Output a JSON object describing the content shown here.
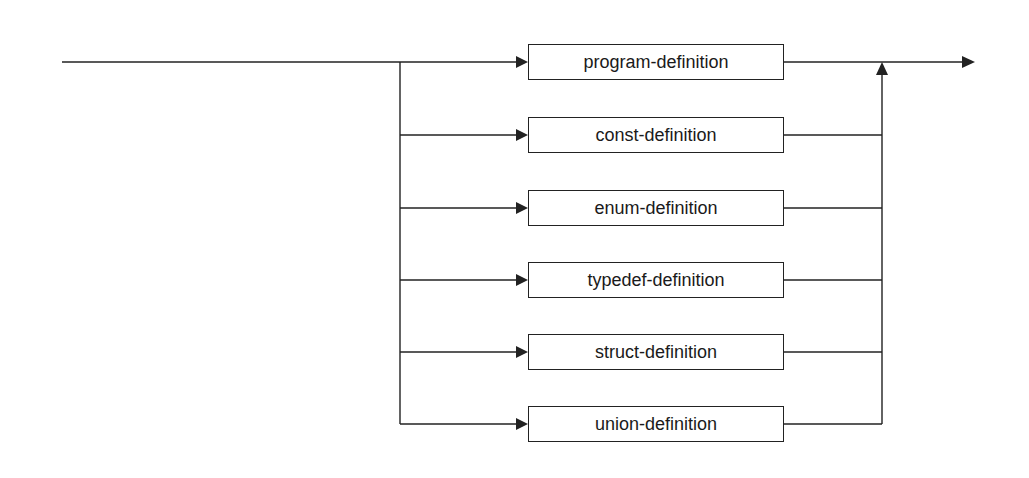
{
  "diagram": {
    "type": "syntax-diagram",
    "alternatives": [
      {
        "label": "program-definition",
        "cy": 62
      },
      {
        "label": "const-definition",
        "cy": 135
      },
      {
        "label": "enum-definition",
        "cy": 208
      },
      {
        "label": "typedef-definition",
        "cy": 280
      },
      {
        "label": "struct-definition",
        "cy": 352
      },
      {
        "label": "union-definition",
        "cy": 424
      }
    ],
    "colors": {
      "line": "#222222",
      "background": "#ffffff",
      "text": "#1a1a1a"
    }
  }
}
